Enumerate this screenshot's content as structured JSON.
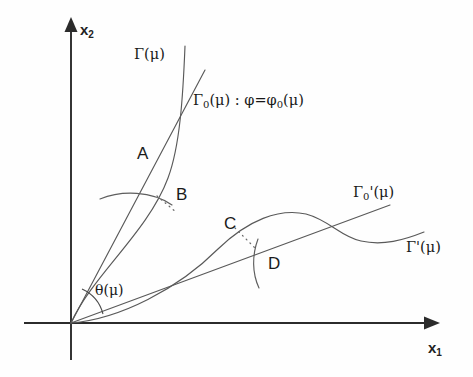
{
  "figure": {
    "type": "mathematical-diagram",
    "background_color": "#fefefe",
    "width": 473,
    "height": 377,
    "axes": {
      "x_label": "x",
      "x_subscript": "1",
      "y_label": "x",
      "y_subscript": "2",
      "origin": {
        "x": 71,
        "y": 323
      },
      "x_axis_end": {
        "x": 428,
        "y": 323
      },
      "y_axis_end": {
        "x": 71,
        "y": 24
      },
      "color": "#2b2b2b"
    },
    "curve_color": "#595959",
    "labels": {
      "gamma": "Γ(μ)",
      "gamma0_main": "Γ",
      "gamma0_sub": "0",
      "gamma0_rest": "(μ) : φ=φ",
      "gamma0_rest_sub": "0",
      "gamma0_tail": "(μ)",
      "gamma0_full": "Γ0(μ) : φ=φ0(μ)",
      "gamma0_prime_main": "Γ",
      "gamma0_prime_sub": "0",
      "gamma0_prime_tail": "'(μ)",
      "gamma0_prime_full": "Γ0'(μ)",
      "gamma_prime": "Γ'(μ)",
      "theta": "θ(μ)",
      "point_a": "A",
      "point_b": "B",
      "point_c": "C",
      "point_d": "D"
    },
    "label_positions": {
      "gamma": {
        "left": 134,
        "top": 47
      },
      "gamma0": {
        "left": 193,
        "top": 93
      },
      "gamma0_prime": {
        "left": 353,
        "top": 185
      },
      "gamma_prime": {
        "left": 406,
        "top": 240
      },
      "theta": {
        "left": 95,
        "top": 283
      },
      "point_a": {
        "left": 137,
        "top": 145
      },
      "point_b": {
        "left": 176,
        "top": 186
      },
      "point_c": {
        "left": 224,
        "top": 215
      },
      "point_d": {
        "left": 268,
        "top": 255
      },
      "x1": {
        "left": 428,
        "top": 340
      },
      "x2": {
        "left": 80,
        "top": 22
      }
    },
    "geometry": {
      "gamma0_line": "M 71 323 L 205 70",
      "gamma_curve": "M 71 323 C 92 276, 148 232, 168 178 C 180 146, 183 96, 185 46",
      "gamma0_prime_line": "M 71 323 L 390 205",
      "gamma_prime_curve": "M 71 323 C 120 318, 176 288, 218 248 C 248 219, 278 208, 305 214 C 328 219, 341 236, 360 241 C 382 247, 403 240, 424 233",
      "tangent_arc_a": "M 100 199 C 122 190, 152 191, 172 205",
      "tangent_arc_d": "M 258 286 C 252 272, 253 255, 258 240",
      "angle_arc": "M 79 298 A 30 30 0 0 1 99 314",
      "dotted_ab": "M 157 196 L 175 211",
      "dotted_cd": "M 236 228 L 256 248"
    }
  }
}
